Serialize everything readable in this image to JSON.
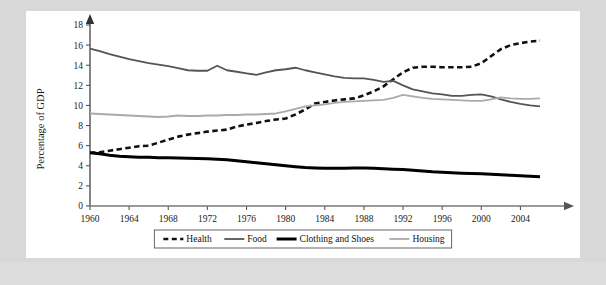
{
  "figure": {
    "background_color": "#d8d8d8",
    "panel_color": "#ffffff"
  },
  "chart_data": {
    "type": "line",
    "title": "",
    "xlabel": "",
    "ylabel": "Percentage of GDP",
    "xlim": [
      1960,
      2006
    ],
    "ylim": [
      0,
      18
    ],
    "grid": false,
    "legend_position": "bottom",
    "x_tick_labels": [
      "1960",
      "1964",
      "1968",
      "1972",
      "1976",
      "1980",
      "1984",
      "1988",
      "1992",
      "1996",
      "2000",
      "2004"
    ],
    "x_ticks": [
      1960,
      1964,
      1968,
      1972,
      1976,
      1980,
      1984,
      1988,
      1992,
      1996,
      2000,
      2004
    ],
    "y_tick_labels": [
      "0",
      "2",
      "4",
      "6",
      "8",
      "10",
      "12",
      "14",
      "16",
      "18"
    ],
    "y_ticks": [
      0,
      2,
      4,
      6,
      8,
      10,
      12,
      14,
      16,
      18
    ],
    "x": [
      1960,
      1961,
      1962,
      1963,
      1964,
      1965,
      1966,
      1967,
      1968,
      1969,
      1970,
      1971,
      1972,
      1973,
      1974,
      1975,
      1976,
      1977,
      1978,
      1979,
      1980,
      1981,
      1982,
      1983,
      1984,
      1985,
      1986,
      1987,
      1988,
      1989,
      1990,
      1991,
      1992,
      1993,
      1994,
      1995,
      1996,
      1997,
      1998,
      1999,
      2000,
      2001,
      2002,
      2003,
      2004,
      2005,
      2006
    ],
    "series": [
      {
        "name": "Health",
        "style": "dashed",
        "color": "#111111",
        "width": 2.6,
        "values": [
          5.3,
          5.35,
          5.5,
          5.65,
          5.8,
          5.95,
          6.0,
          6.3,
          6.6,
          6.9,
          7.1,
          7.25,
          7.4,
          7.5,
          7.6,
          7.9,
          8.1,
          8.25,
          8.45,
          8.6,
          8.7,
          9.1,
          9.6,
          10.2,
          10.35,
          10.5,
          10.6,
          10.7,
          11.0,
          11.4,
          11.9,
          12.6,
          13.3,
          13.75,
          13.85,
          13.85,
          13.8,
          13.8,
          13.8,
          13.85,
          14.2,
          14.9,
          15.6,
          16.0,
          16.2,
          16.35,
          16.45
        ]
      },
      {
        "name": "Food",
        "style": "solid",
        "color": "#555555",
        "width": 1.8,
        "values": [
          15.65,
          15.4,
          15.1,
          14.85,
          14.6,
          14.4,
          14.2,
          14.05,
          13.9,
          13.7,
          13.5,
          13.45,
          13.45,
          13.95,
          13.5,
          13.35,
          13.2,
          13.05,
          13.3,
          13.5,
          13.6,
          13.75,
          13.5,
          13.3,
          13.1,
          12.9,
          12.75,
          12.7,
          12.7,
          12.55,
          12.35,
          12.45,
          12.0,
          11.6,
          11.4,
          11.2,
          11.1,
          10.95,
          10.95,
          11.05,
          11.1,
          10.9,
          10.6,
          10.35,
          10.15,
          10.0,
          9.9
        ]
      },
      {
        "name": "Clothing and Shoes",
        "style": "solid",
        "color": "#000000",
        "width": 3.0,
        "values": [
          5.3,
          5.2,
          5.05,
          4.95,
          4.9,
          4.85,
          4.85,
          4.8,
          4.8,
          4.78,
          4.75,
          4.72,
          4.7,
          4.65,
          4.6,
          4.5,
          4.4,
          4.3,
          4.2,
          4.1,
          4.0,
          3.9,
          3.82,
          3.78,
          3.75,
          3.75,
          3.76,
          3.77,
          3.78,
          3.75,
          3.7,
          3.65,
          3.62,
          3.55,
          3.48,
          3.4,
          3.35,
          3.3,
          3.25,
          3.22,
          3.2,
          3.15,
          3.1,
          3.05,
          3.0,
          2.95,
          2.9
        ]
      },
      {
        "name": "Housing",
        "style": "solid",
        "color": "#aaaaaa",
        "width": 1.8,
        "values": [
          9.2,
          9.15,
          9.1,
          9.05,
          9.0,
          8.95,
          8.9,
          8.85,
          8.9,
          9.0,
          8.95,
          8.95,
          9.0,
          9.0,
          9.05,
          9.05,
          9.1,
          9.1,
          9.15,
          9.2,
          9.4,
          9.65,
          9.9,
          10.0,
          10.1,
          10.25,
          10.35,
          10.4,
          10.45,
          10.5,
          10.55,
          10.75,
          11.05,
          10.9,
          10.75,
          10.65,
          10.6,
          10.55,
          10.5,
          10.45,
          10.45,
          10.6,
          10.8,
          10.7,
          10.65,
          10.65,
          10.7
        ]
      }
    ]
  },
  "legend": {
    "items": [
      {
        "label": "Health",
        "style": "dashed",
        "color": "#111111"
      },
      {
        "label": "Food",
        "style": "solid",
        "color": "#555555"
      },
      {
        "label": "Clothing and Shoes",
        "style": "solid",
        "color": "#000000"
      },
      {
        "label": "Housing",
        "style": "solid",
        "color": "#aaaaaa"
      }
    ]
  }
}
